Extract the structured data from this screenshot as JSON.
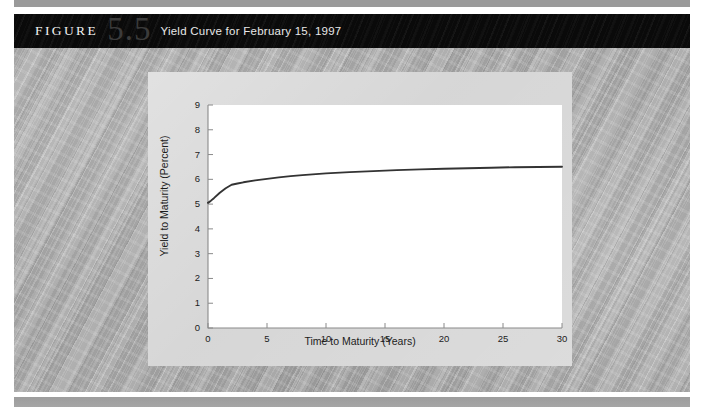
{
  "figure": {
    "label": "FIGURE",
    "number": "5.5",
    "title": "Yield Curve for February 15, 1997"
  },
  "colors": {
    "header_bar": "#0a0a0a",
    "header_text": "#f2f2f2",
    "figure_number": "#3b3b3b",
    "panel_bg": "#d2d2d2",
    "plot_bg": "#ffffff",
    "curve": "#333333",
    "axis": "#8a8a8a",
    "page_bg": "#a7a7a7"
  },
  "chart_data": {
    "type": "line",
    "title": "Yield Curve for February 15, 1997",
    "xlabel": "Time to Maturity (Years)",
    "ylabel": "Yield to Maturity (Percent)",
    "xlim": [
      0,
      30
    ],
    "ylim": [
      0,
      9
    ],
    "xticks": [
      "0",
      "5",
      "10",
      "15",
      "20",
      "25",
      "30"
    ],
    "yticks": [
      "0",
      "1",
      "2",
      "3",
      "4",
      "5",
      "6",
      "7",
      "8",
      "9"
    ],
    "grid": false,
    "legend": null,
    "series": [
      {
        "name": "Treasury yield curve",
        "x": [
          0,
          0.25,
          0.5,
          1,
          1.5,
          2,
          2.5,
          3,
          4,
          5,
          6,
          7,
          8,
          10,
          12,
          14,
          16,
          18,
          20,
          22,
          24,
          26,
          28,
          30
        ],
        "y": [
          5.05,
          5.14,
          5.24,
          5.46,
          5.64,
          5.78,
          5.83,
          5.88,
          5.96,
          6.02,
          6.08,
          6.13,
          6.17,
          6.24,
          6.29,
          6.33,
          6.37,
          6.4,
          6.43,
          6.45,
          6.47,
          6.49,
          6.5,
          6.51
        ]
      }
    ]
  }
}
